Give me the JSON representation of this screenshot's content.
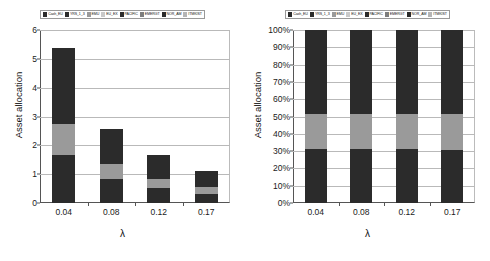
{
  "legend": {
    "entries": [
      {
        "label": "Cash_EU",
        "color": "#2b2b2b"
      },
      {
        "label": "YRS_1_3",
        "color": "#2b2b2b"
      },
      {
        "label": "EMU",
        "color": "#9a9a9a"
      },
      {
        "label": "EU_EX",
        "color": "#c9c9c9"
      },
      {
        "label": "PACIFIC",
        "color": "#2b2b2b"
      },
      {
        "label": "EMERGT",
        "color": "#7d7d7d"
      },
      {
        "label": "NOR_AM",
        "color": "#2b2b2b"
      },
      {
        "label": "ITMKIST",
        "color": "#b5b5b5"
      }
    ]
  },
  "chart_data": [
    {
      "type": "bar",
      "id": "absolute-allocation",
      "title": "",
      "stacked": true,
      "xlabel": "λ",
      "ylabel": "Asset allocation",
      "categories": [
        "0.04",
        "0.08",
        "0.12",
        "0.17"
      ],
      "ylim": [
        0,
        6
      ],
      "yticks": [
        "0",
        "1",
        "2",
        "3",
        "4",
        "5",
        "6"
      ],
      "ytick_values": [
        0,
        1,
        2,
        3,
        4,
        5,
        6
      ],
      "grid": true,
      "legend_position": "top",
      "series": [
        {
          "name": "Cash_EU",
          "color": "#2b2b2b",
          "values": [
            1.65,
            0.83,
            0.52,
            0.33
          ]
        },
        {
          "name": "EMU",
          "color": "#9a9a9a",
          "values": [
            1.1,
            0.52,
            0.32,
            0.22
          ]
        },
        {
          "name": "NOR_AM",
          "color": "#2b2b2b",
          "values": [
            2.62,
            1.23,
            0.81,
            0.55
          ]
        }
      ],
      "totals": [
        5.37,
        2.58,
        1.65,
        1.1
      ]
    },
    {
      "type": "bar",
      "id": "percentage-allocation",
      "title": "",
      "stacked": true,
      "normalized": true,
      "xlabel": "λ",
      "ylabel": "Asset allocation",
      "categories": [
        "0.04",
        "0.08",
        "0.12",
        "0.17"
      ],
      "ylim": [
        0,
        100
      ],
      "yticks": [
        "0%",
        "10%",
        "20%",
        "30%",
        "40%",
        "50%",
        "60%",
        "70%",
        "80%",
        "90%",
        "100%"
      ],
      "ytick_values": [
        0,
        10,
        20,
        30,
        40,
        50,
        60,
        70,
        80,
        90,
        100
      ],
      "grid": true,
      "legend_position": "top",
      "series": [
        {
          "name": "Cash_EU",
          "color": "#2b2b2b",
          "values": [
            31,
            31,
            31,
            30.5
          ]
        },
        {
          "name": "EMU",
          "color": "#9a9a9a",
          "values": [
            20.5,
            20.5,
            20.5,
            21
          ]
        },
        {
          "name": "NOR_AM",
          "color": "#2b2b2b",
          "values": [
            48.5,
            48.5,
            48.5,
            48.5
          ]
        }
      ],
      "totals": [
        100,
        100,
        100,
        100
      ]
    }
  ]
}
